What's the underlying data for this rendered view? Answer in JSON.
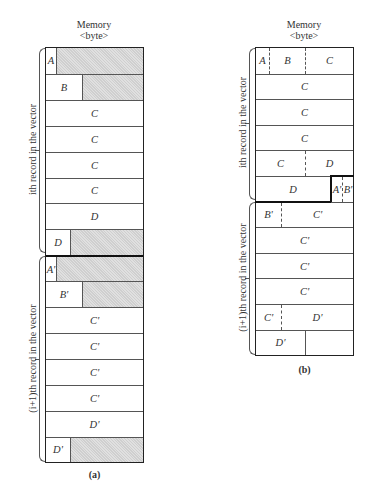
{
  "figure_a": {
    "header_line1": "Memory",
    "header_line2": "<byte>",
    "caption": "(a)",
    "brace_labels": {
      "record_i": "ith record in the vector",
      "record_i1": "(i+1)th record in the vector"
    },
    "rows": [
      {
        "cells": [
          {
            "label": "A",
            "w": 10
          },
          {
            "label": "",
            "pad": true
          }
        ]
      },
      {
        "cells": [
          {
            "label": "B",
            "w": 36
          },
          {
            "label": "",
            "pad": true
          }
        ]
      },
      {
        "cells": [
          {
            "label": "C"
          }
        ]
      },
      {
        "cells": [
          {
            "label": "C"
          }
        ]
      },
      {
        "cells": [
          {
            "label": "C"
          }
        ]
      },
      {
        "cells": [
          {
            "label": "C"
          }
        ]
      },
      {
        "cells": [
          {
            "label": "D"
          }
        ]
      },
      {
        "cells": [
          {
            "label": "D",
            "w": 24
          },
          {
            "label": "",
            "pad": true
          }
        ]
      },
      {
        "cells": [
          {
            "label": "A'",
            "w": 10
          },
          {
            "label": "",
            "pad": true
          }
        ]
      },
      {
        "cells": [
          {
            "label": "B'",
            "w": 36
          },
          {
            "label": "",
            "pad": true
          }
        ]
      },
      {
        "cells": [
          {
            "label": "C'"
          }
        ]
      },
      {
        "cells": [
          {
            "label": "C'"
          }
        ]
      },
      {
        "cells": [
          {
            "label": "C'"
          }
        ]
      },
      {
        "cells": [
          {
            "label": "C'"
          }
        ]
      },
      {
        "cells": [
          {
            "label": "D'"
          }
        ]
      },
      {
        "cells": [
          {
            "label": "D'",
            "w": 24
          },
          {
            "label": "",
            "pad": true
          }
        ]
      }
    ]
  },
  "figure_b": {
    "header_line1": "Memory",
    "header_line2": "<byte>",
    "caption": "(b)",
    "brace_labels": {
      "record_i": "ith record in the vector",
      "record_i1": "(i+1)th record in the vector"
    },
    "rows": [
      {
        "cells": [
          {
            "label": "A",
            "w": 13
          },
          {
            "label": "B",
            "w": 36,
            "dash": true
          },
          {
            "label": "C",
            "dash": true
          }
        ]
      },
      {
        "cells": [
          {
            "label": "C"
          }
        ]
      },
      {
        "cells": [
          {
            "label": "C"
          }
        ]
      },
      {
        "cells": [
          {
            "label": "C"
          }
        ]
      },
      {
        "cells": [
          {
            "label": "C",
            "w": 49
          },
          {
            "label": "D",
            "dash": true
          }
        ]
      },
      {
        "cells": [
          {
            "label": "D",
            "w": 74
          },
          {
            "label": "A'",
            "w": 12,
            "thick": true
          },
          {
            "label": "B'",
            "dash": true
          }
        ]
      },
      {
        "cells": [
          {
            "label": "B'",
            "w": 25
          },
          {
            "label": "C'",
            "dash": true
          }
        ]
      },
      {
        "cells": [
          {
            "label": "C'"
          }
        ]
      },
      {
        "cells": [
          {
            "label": "C'"
          }
        ]
      },
      {
        "cells": [
          {
            "label": "C'"
          }
        ]
      },
      {
        "cells": [
          {
            "label": "C'",
            "w": 25
          },
          {
            "label": "D'",
            "dash": true
          }
        ]
      },
      {
        "cells": [
          {
            "label": "D'",
            "w": 49
          },
          {
            "label": "",
            "solid": true
          }
        ]
      }
    ]
  }
}
